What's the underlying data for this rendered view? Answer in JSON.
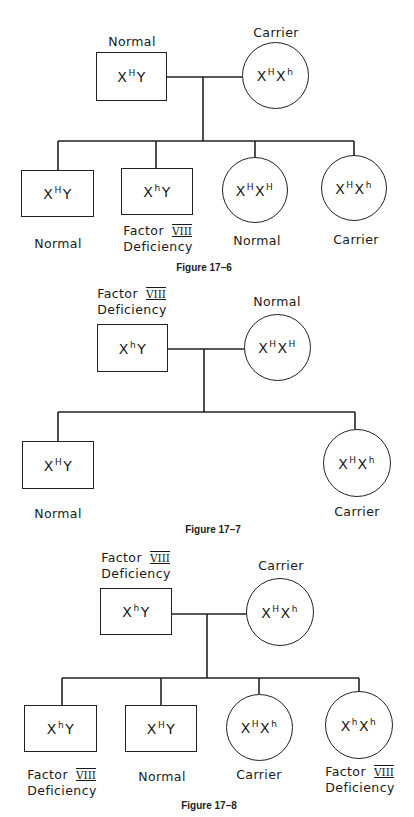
{
  "figures": [
    {
      "caption": "Figure 17–6",
      "father": {
        "allele1": "H",
        "allele2": "Y",
        "label_lines": [
          "Normal"
        ]
      },
      "mother": {
        "allele1": "H",
        "allele2": "h",
        "label_lines": [
          "Carrier"
        ]
      },
      "children": [
        {
          "sex": "male",
          "allele1": "H",
          "allele2": "Y",
          "label_lines": [
            "Normal"
          ]
        },
        {
          "sex": "male",
          "allele1": "h",
          "allele2": "Y",
          "label_lines": [
            "Factor",
            "Deficiency"
          ],
          "roman": "VIII"
        },
        {
          "sex": "female",
          "allele1": "H",
          "allele2": "H",
          "label_lines": [
            "Normal"
          ]
        },
        {
          "sex": "female",
          "allele1": "H",
          "allele2": "h",
          "label_lines": [
            "Carrier"
          ]
        }
      ]
    },
    {
      "caption": "Figure 17–7",
      "father": {
        "allele1": "h",
        "allele2": "Y",
        "label_lines": [
          "Factor",
          "Deficiency"
        ],
        "roman": "VIII"
      },
      "mother": {
        "allele1": "H",
        "allele2": "H",
        "label_lines": [
          "Normal"
        ]
      },
      "children": [
        {
          "sex": "male",
          "allele1": "H",
          "allele2": "Y",
          "label_lines": [
            "Normal"
          ]
        },
        {
          "sex": "female",
          "allele1": "H",
          "allele2": "h",
          "label_lines": [
            "Carrier"
          ]
        }
      ]
    },
    {
      "caption": "Figure 17–8",
      "father": {
        "allele1": "h",
        "allele2": "Y",
        "label_lines": [
          "Factor",
          "Deficiency"
        ],
        "roman": "VIII"
      },
      "mother": {
        "allele1": "H",
        "allele2": "h",
        "label_lines": [
          "Carrier"
        ]
      },
      "children": [
        {
          "sex": "male",
          "allele1": "h",
          "allele2": "Y",
          "label_lines": [
            "Factor",
            "Deficiency"
          ],
          "roman": "VIII"
        },
        {
          "sex": "male",
          "allele1": "H",
          "allele2": "Y",
          "label_lines": [
            "Normal"
          ]
        },
        {
          "sex": "female",
          "allele1": "H",
          "allele2": "h",
          "label_lines": [
            "Carrier"
          ]
        },
        {
          "sex": "female",
          "allele1": "h",
          "allele2": "h",
          "label_lines": [
            "Factor",
            "Deficiency"
          ],
          "roman": "VIII"
        }
      ]
    }
  ],
  "symbols": {
    "x_chromosome": "X",
    "male_shape": "square",
    "female_shape": "circle"
  },
  "colors": {
    "ink": "#222222",
    "background": "#ffffff"
  }
}
